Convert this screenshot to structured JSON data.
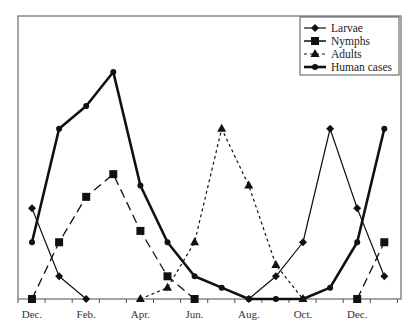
{
  "chart_data": {
    "type": "line",
    "title": "",
    "xlabel": "",
    "ylabel": "",
    "ylim": [
      0,
      100
    ],
    "grid": false,
    "legend_position": "upper right (inside)",
    "x": [
      "Dec.",
      "Jan.",
      "Feb.",
      "Mar.",
      "Apr.",
      "May",
      "Jun.",
      "Jul.",
      "Aug.",
      "Sep.",
      "Oct.",
      "Nov.",
      "Dec.",
      "Jan."
    ],
    "x_tick_labels": [
      "Dec.",
      "Feb.",
      "Apr.",
      "Jun.",
      "Aug.",
      "Oct.",
      "Dec."
    ],
    "series": [
      {
        "name": "Larvae",
        "marker": "diamond",
        "line": "thin-solid",
        "values": [
          40,
          10,
          0,
          null,
          null,
          null,
          null,
          null,
          0,
          10,
          25,
          75,
          40,
          10
        ]
      },
      {
        "name": "Nymphs",
        "marker": "square",
        "line": "long-dash",
        "values": [
          0,
          25,
          45,
          55,
          30,
          10,
          0,
          null,
          null,
          null,
          null,
          null,
          0,
          25
        ]
      },
      {
        "name": "Adults",
        "marker": "triangle",
        "line": "short-dash",
        "values": [
          null,
          null,
          null,
          null,
          0,
          5,
          25,
          75,
          50,
          15,
          0,
          null,
          null,
          null
        ]
      },
      {
        "name": "Human cases",
        "marker": "circle",
        "line": "thick-solid",
        "values": [
          25,
          75,
          85,
          100,
          50,
          25,
          10,
          5,
          0,
          0,
          0,
          5,
          25,
          75
        ]
      }
    ]
  }
}
